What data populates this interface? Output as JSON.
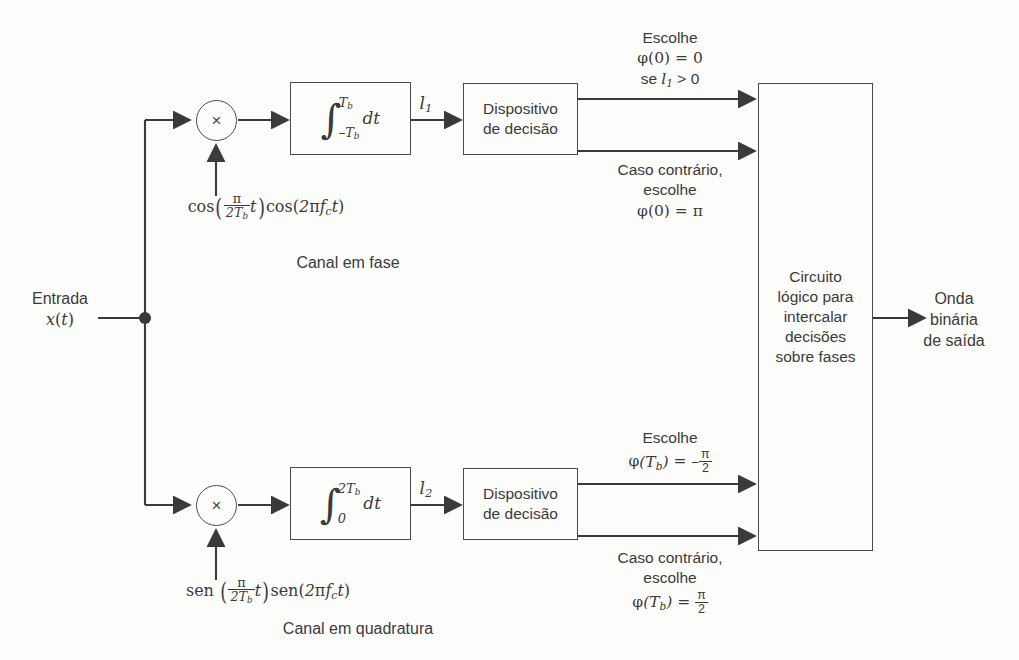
{
  "diagram": {
    "input": {
      "line1": "Entrada",
      "line2": "x(t)"
    },
    "output": {
      "line1": "Onda",
      "line2": "binária",
      "line3": "de saída"
    },
    "channels": {
      "in_phase_caption": "Canal em fase",
      "quadrature_caption": "Canal em quadratura"
    },
    "multiplier_symbol": "×",
    "upper": {
      "local_carrier": "cos(π/2T_b t)cos(2πf_c t)",
      "integrator": {
        "lower_limit": "-T_b",
        "upper_limit": "T_b",
        "differential": "dt"
      },
      "signal_label": "l_1",
      "decision_device": {
        "line1": "Dispositivo",
        "line2": "de decisão"
      },
      "decision_top": {
        "line1": "Escolhe",
        "line2": "φ(0) = 0",
        "line3": "se l_1 > 0"
      },
      "decision_bottom": {
        "line1": "Caso contrário,",
        "line2": "escolhe",
        "line3": "φ(0) = π"
      }
    },
    "lower": {
      "local_carrier": "sen(π/2T_b t)sen(2πf_c t)",
      "integrator": {
        "lower_limit": "0",
        "upper_limit": "2T_b",
        "differential": "dt"
      },
      "signal_label": "l_2",
      "decision_device": {
        "line1": "Dispositivo",
        "line2": "de decisão"
      },
      "decision_top": {
        "line1": "Escolhe",
        "line2": "φ(T_b) = -π/2"
      },
      "decision_bottom": {
        "line1": "Caso contrário,",
        "line2": "escolhe",
        "line3": "φ(T_b) = π/2"
      }
    },
    "logic_block": {
      "line1": "Circuito",
      "line2": "lógico para",
      "line3": "intercalar",
      "line4": "decisões",
      "line5": "sobre fases"
    },
    "colors": {
      "line": "#4a4a4a",
      "text": "#3a3a3a",
      "background": "#fdfdfb"
    }
  }
}
